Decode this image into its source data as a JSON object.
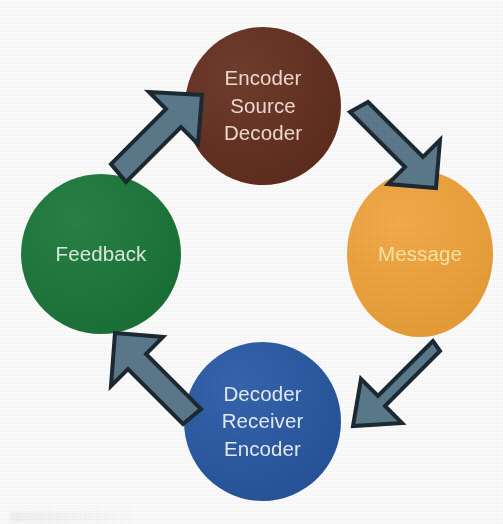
{
  "diagram": {
    "type": "cyclical-communication-model",
    "background_color": "#fefefe",
    "nodes": [
      {
        "id": "source",
        "position": "top",
        "color": "#693222",
        "text_color": "#f2ded2",
        "lines": [
          "Encoder",
          "Source",
          "Decoder"
        ]
      },
      {
        "id": "message",
        "position": "right",
        "color": "#f5a63b",
        "text_color": "#fbe7a8",
        "lines": [
          "Message"
        ]
      },
      {
        "id": "receiver",
        "position": "bottom",
        "color": "#2a5caa",
        "text_color": "#e9eef7",
        "lines": [
          "Decoder",
          "Receiver",
          "Encoder"
        ]
      },
      {
        "id": "feedback",
        "position": "left",
        "color": "#1c7c3c",
        "text_color": "#dfeee2",
        "lines": [
          "Feedback"
        ]
      }
    ],
    "arrows": [
      {
        "id": "source-to-message",
        "direction": "down-right",
        "from": "source",
        "to": "message",
        "fill": "#5c7a8c",
        "stroke": "#1d2a33"
      },
      {
        "id": "message-to-receiver",
        "direction": "down-left",
        "from": "message",
        "to": "receiver",
        "fill": "#5c7a8c",
        "stroke": "#1d2a33"
      },
      {
        "id": "receiver-to-feedback",
        "direction": "up-left",
        "from": "receiver",
        "to": "feedback",
        "fill": "#5c7a8c",
        "stroke": "#1d2a33"
      },
      {
        "id": "feedback-to-source",
        "direction": "up-right",
        "from": "feedback",
        "to": "source",
        "fill": "#5c7a8c",
        "stroke": "#1d2a33"
      }
    ]
  }
}
